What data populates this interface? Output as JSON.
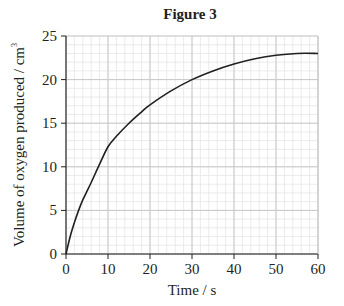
{
  "chart_data": {
    "type": "line",
    "title": "Figure 3",
    "xlabel": "Time / s",
    "ylabel": "Volume of oxygen produced / cm",
    "ylabel_superscript": "3",
    "xlim": [
      0,
      60
    ],
    "ylim": [
      0,
      25
    ],
    "x_ticks": [
      0,
      10,
      20,
      30,
      40,
      50,
      60
    ],
    "y_ticks": [
      0,
      5,
      10,
      15,
      20,
      25
    ],
    "x_minor_step": 2,
    "y_minor_step": 1,
    "grid": true,
    "legend": null,
    "series": [
      {
        "name": "Oxygen volume",
        "color": "#231f20",
        "x": [
          0,
          1,
          2,
          3,
          4,
          5,
          6,
          8,
          10,
          12,
          15,
          18,
          20,
          25,
          30,
          35,
          40,
          45,
          50,
          55,
          60
        ],
        "values": [
          0,
          2.0,
          3.6,
          5.0,
          6.2,
          7.2,
          8.2,
          10.3,
          12.3,
          13.5,
          15.0,
          16.3,
          17.1,
          18.7,
          20.0,
          21.0,
          21.8,
          22.4,
          22.8,
          23.0,
          23.0
        ]
      }
    ]
  },
  "colors": {
    "axis": "#231f20",
    "major_grid": "#c8c8c8",
    "minor_grid": "#e6e6e6",
    "curve": "#231f20"
  }
}
